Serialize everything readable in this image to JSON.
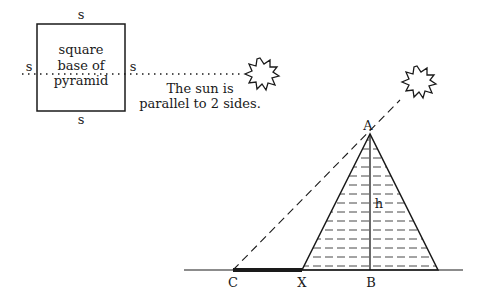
{
  "diagram": {
    "colors": {
      "ink": "#1a1a1a",
      "background": "#ffffff"
    },
    "top_view": {
      "side_labels": {
        "top": "s",
        "bottom": "s",
        "left": "s",
        "right": "s"
      },
      "square_text": [
        "square",
        "base of",
        "pyramid"
      ],
      "caption": [
        "The sun is",
        "parallel to 2 sides."
      ],
      "sun_icon": "sun-starburst-icon"
    },
    "side_view": {
      "points": {
        "apex": "A",
        "base_center": "B",
        "shadow_tip": "C",
        "base_edge": "X"
      },
      "height_label": "h",
      "sun_icon": "sun-starburst-icon"
    }
  }
}
